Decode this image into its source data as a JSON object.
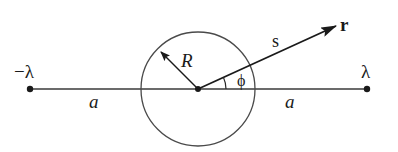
{
  "diagram": {
    "labels": {
      "neg_charge": "−λ",
      "pos_charge": "λ",
      "radius": "R",
      "distance_s": "s",
      "vector_r": "r",
      "angle_phi": "ϕ",
      "left_distance": "a",
      "right_distance": "a"
    },
    "geometry": {
      "center": [
        198,
        89
      ],
      "circle_radius": 57,
      "left_point": [
        30,
        89
      ],
      "right_point": [
        367,
        89
      ],
      "r_arrow_tip": [
        336,
        26
      ],
      "R_arrow_tip": [
        161,
        52
      ]
    },
    "colors": {
      "stroke": "#2a2a2a",
      "background": "#ffffff"
    }
  }
}
